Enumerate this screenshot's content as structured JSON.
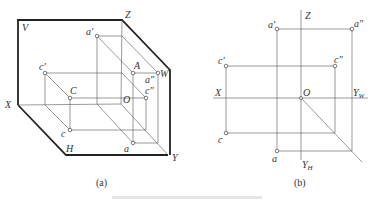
{
  "figure_a": {
    "caption": "(a)",
    "plane_labels": {
      "V": "V",
      "H": "H",
      "W": "W"
    },
    "axis_labels": {
      "X": "X",
      "Y": "Y",
      "Z": "Z",
      "O": "O"
    },
    "points": {
      "a_prime": "a'",
      "A": "A",
      "a_dprime": "a\"",
      "c_prime": "c'",
      "C": "C",
      "c_dprime": "c\"",
      "c": "c",
      "a": "a"
    }
  },
  "figure_b": {
    "caption": "(b)",
    "axis_labels": {
      "X": "X",
      "Z": "Z",
      "O": "O",
      "YW": "Y",
      "YW_sub": "W",
      "YH": "Y",
      "YH_sub": "H"
    },
    "points": {
      "a_prime": "a'",
      "a_dprime": "a\"",
      "c_prime": "c'",
      "c_dprime": "c\"",
      "c": "c",
      "a": "a"
    }
  },
  "colors": {
    "line": "#555555",
    "frame": "#222222",
    "text": "#333333"
  }
}
